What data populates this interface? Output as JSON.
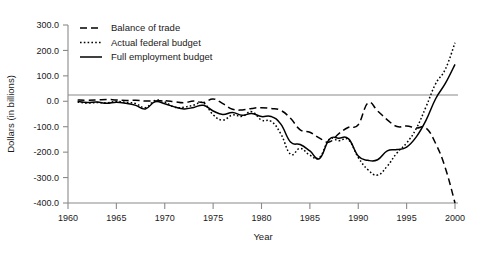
{
  "chart_data": {
    "type": "line",
    "title": "",
    "xlabel": "Year",
    "ylabel": "Dollars (in billions)",
    "xlim": [
      1960,
      2000
    ],
    "ylim": [
      -400,
      300
    ],
    "grid": false,
    "legend_position": "top-left",
    "x_tick_labels": [
      "1960",
      "1965",
      "1970",
      "1975",
      "1980",
      "1985",
      "1990",
      "1995",
      "2000"
    ],
    "x_ticks": [
      1960,
      1965,
      1970,
      1975,
      1980,
      1985,
      1990,
      1995,
      2000
    ],
    "y_tick_labels": [
      "300.0",
      "200.0",
      "100.0",
      "0.0",
      "-100.0",
      "-200.0",
      "-300.0",
      "-400.0"
    ],
    "y_ticks": [
      300,
      200,
      100,
      0,
      -100,
      -200,
      -300,
      -400
    ],
    "x": [
      1961,
      1962,
      1963,
      1964,
      1965,
      1966,
      1967,
      1968,
      1969,
      1970,
      1971,
      1972,
      1973,
      1974,
      1975,
      1976,
      1977,
      1978,
      1979,
      1980,
      1981,
      1982,
      1983,
      1984,
      1985,
      1986,
      1987,
      1988,
      1989,
      1990,
      1991,
      1992,
      1993,
      1994,
      1995,
      1996,
      1997,
      1998,
      1999,
      2000
    ],
    "series": [
      {
        "name": "Balance of trade",
        "style": "dashed",
        "values": [
          5,
          4,
          5,
          7,
          5,
          3,
          4,
          1,
          1,
          2,
          -2,
          -6,
          1,
          -5,
          9,
          -9,
          -31,
          -34,
          -28,
          -25,
          -28,
          -36,
          -67,
          -112,
          -122,
          -145,
          -160,
          -127,
          -102,
          -92,
          -7,
          -38,
          -73,
          -99,
          -97,
          -105,
          -105,
          -166,
          -262,
          -400
        ]
      },
      {
        "name": "Actual federal budget",
        "style": "dotted",
        "values": [
          -3,
          -7,
          -5,
          -6,
          -1,
          -4,
          -9,
          -25,
          3,
          -3,
          -23,
          -23,
          -15,
          -6,
          -53,
          -74,
          -54,
          -59,
          -41,
          -74,
          -79,
          -128,
          -208,
          -185,
          -212,
          -221,
          -150,
          -155,
          -152,
          -221,
          -269,
          -290,
          -255,
          -203,
          -164,
          -107,
          -22,
          69,
          126,
          230
        ]
      },
      {
        "name": "Full employment budget",
        "style": "solid",
        "values": [
          -1,
          -5,
          -3,
          -8,
          -4,
          -8,
          -16,
          -30,
          -2,
          -10,
          -22,
          -30,
          -24,
          -16,
          -38,
          -52,
          -44,
          -55,
          -48,
          -60,
          -60,
          -90,
          -160,
          -170,
          -195,
          -225,
          -150,
          -145,
          -148,
          -215,
          -232,
          -230,
          -195,
          -190,
          -180,
          -140,
          -75,
          10,
          70,
          145
        ]
      }
    ]
  },
  "legend": {
    "items": [
      {
        "label": "Balance of trade",
        "swatch": "dashed-line-swatch"
      },
      {
        "label": "Actual federal budget",
        "swatch": "dotted-line-swatch"
      },
      {
        "label": "Full employment budget",
        "swatch": "solid-line-swatch"
      }
    ]
  },
  "axes": {
    "y_title": "Dollars (in billions)",
    "x_title": "Year"
  },
  "colors": {
    "line": "#000000",
    "axis": "#8a8a8a",
    "text": "#1a1a1a",
    "background": "#ffffff"
  }
}
